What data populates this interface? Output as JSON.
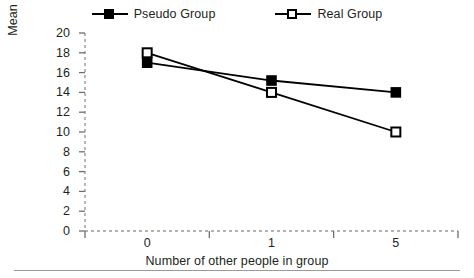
{
  "chart_data": {
    "type": "line",
    "title": "",
    "xlabel": "Number of other people in group",
    "ylabel": "Mean number of errors found",
    "categories": [
      "0",
      "1",
      "5"
    ],
    "series": [
      {
        "name": "Pseudo Group",
        "marker": "filled-square",
        "values": [
          17,
          15.2,
          14
        ]
      },
      {
        "name": "Real Group",
        "marker": "open-square",
        "values": [
          18,
          14,
          10
        ]
      }
    ],
    "ylim": [
      0,
      20
    ],
    "yticks": [
      "20",
      "18",
      "16",
      "14",
      "12",
      "10",
      "8",
      "6",
      "4",
      "2",
      "0"
    ],
    "ytick_values": [
      20,
      18,
      16,
      14,
      12,
      10,
      8,
      6,
      4,
      2,
      0
    ],
    "grid": false,
    "legend_position": "top",
    "axis_style": "dashed",
    "colors": {
      "line": "#000000",
      "axis": "#9a9a9a",
      "text": "#231f20",
      "background": "#ffffff"
    }
  },
  "legend": {
    "items": [
      {
        "label": "Pseudo Group",
        "marker": "filled-square"
      },
      {
        "label": "Real Group",
        "marker": "open-square"
      }
    ]
  },
  "axes": {
    "y_title": "Mean number of errors found",
    "x_title": "Number of other people in group"
  }
}
